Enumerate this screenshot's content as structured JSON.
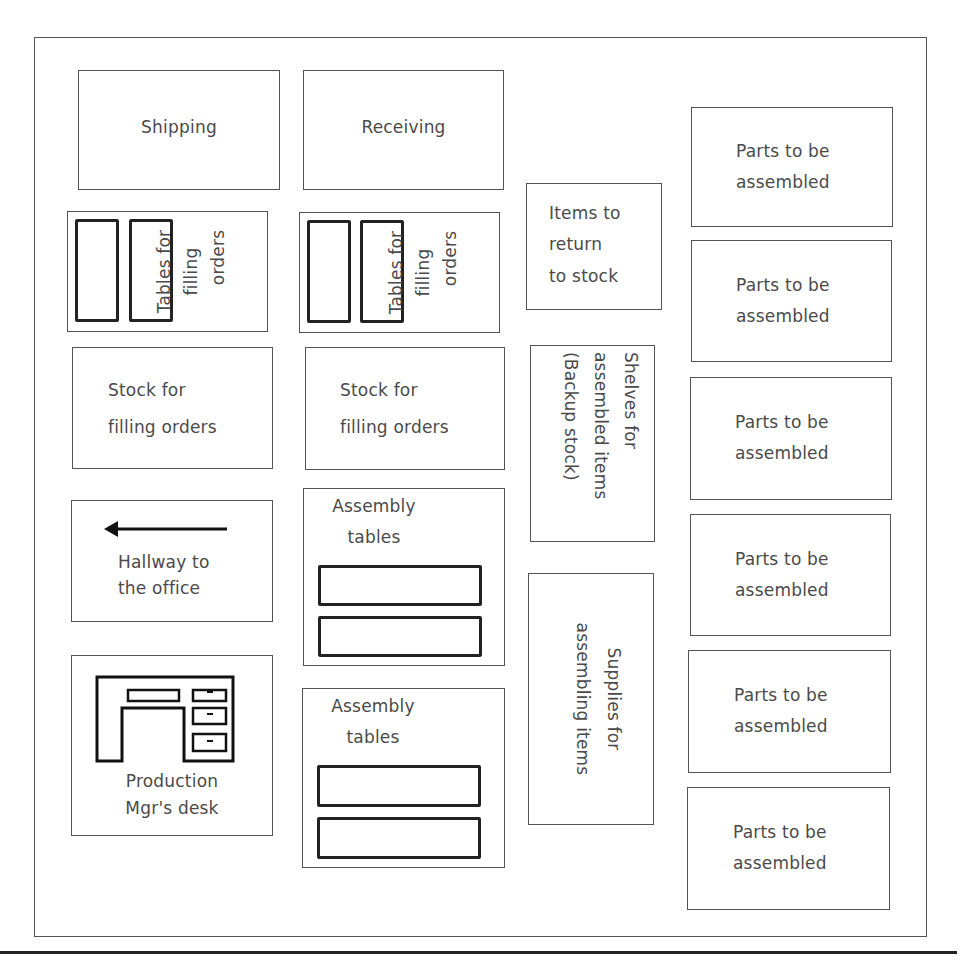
{
  "diagram": {
    "type": "floor-plan",
    "rooms": {
      "shipping": {
        "label": "Shipping"
      },
      "receiving": {
        "label": "Receiving"
      },
      "tables_filling_1": {
        "label": [
          "Tables for",
          "filling",
          "orders"
        ]
      },
      "tables_filling_2": {
        "label": [
          "Tables for",
          "filling",
          "orders"
        ]
      },
      "items_return": {
        "label": [
          "Items to",
          "return",
          "to stock"
        ]
      },
      "stock_1": {
        "label": [
          "Stock for",
          "filling orders"
        ]
      },
      "stock_2": {
        "label": [
          "Stock for",
          "filling orders"
        ]
      },
      "shelves": {
        "label": [
          "Shelves for",
          "assembled items",
          "(Backup stock)"
        ]
      },
      "hallway": {
        "label": [
          "Hallway to",
          "the office"
        ],
        "icon": "arrow-left-icon"
      },
      "assembly_1": {
        "label": [
          "Assembly",
          "tables"
        ]
      },
      "assembly_2": {
        "label": [
          "Assembly",
          "tables"
        ]
      },
      "supplies": {
        "label": [
          "Supplies for",
          "assembling items"
        ]
      },
      "desk": {
        "label": [
          "Production",
          "Mgr's desk"
        ],
        "icon": "desk-icon"
      }
    },
    "parts": [
      {
        "label": [
          "Parts to be",
          "assembled"
        ]
      },
      {
        "label": [
          "Parts to be",
          "assembled"
        ]
      },
      {
        "label": [
          "Parts to be",
          "assembled"
        ]
      },
      {
        "label": [
          "Parts to be",
          "assembled"
        ]
      },
      {
        "label": [
          "Parts to be",
          "assembled"
        ]
      },
      {
        "label": [
          "Parts to be",
          "assembled"
        ]
      }
    ],
    "colors": {
      "line": "#555555",
      "table_line": "#222222",
      "text": "#4a4a4a",
      "background": "#ffffff"
    }
  }
}
